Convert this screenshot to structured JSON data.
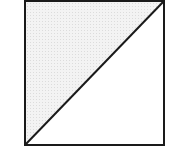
{
  "diagram": {
    "type": "square-with-diagonal",
    "square": {
      "x": 25,
      "y": 1,
      "width": 139,
      "height": 144
    },
    "diagonal": {
      "from": "bottom-left",
      "to": "top-right"
    },
    "shaded_region": "upper-left-triangle",
    "colors": {
      "stroke": "#1a1a1a",
      "shade_base": "#f3f3f3",
      "shade_dot": "#dcdcdc",
      "background": "#ffffff"
    },
    "stroke_width": 2
  }
}
